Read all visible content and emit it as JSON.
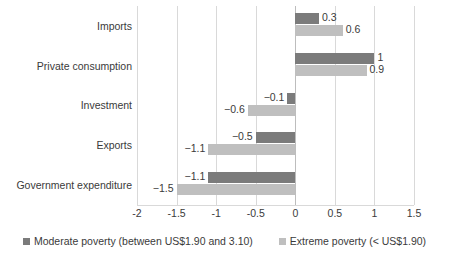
{
  "chart_data": {
    "type": "bar",
    "orientation": "horizontal",
    "title": "",
    "subtitle": "",
    "xlabel": "",
    "ylabel": "",
    "xlim": [
      -2,
      1.5
    ],
    "xticks": [
      "-2",
      "-1.5",
      "-1",
      "-0.5",
      "0",
      "0.5",
      "1",
      "1.5"
    ],
    "xtick_values": [
      -2,
      -1.5,
      -1,
      -0.5,
      0,
      0.5,
      1,
      1.5
    ],
    "grid": true,
    "legend_position": "bottom",
    "categories": [
      "Imports",
      "Private consumption",
      "Investment",
      "Exports",
      "Government expenditure"
    ],
    "series": [
      {
        "name": "Moderate poverty (between US$1.90 and 3.10)",
        "color": "#7b7b7b",
        "values": [
          0.3,
          1,
          -0.1,
          -0.5,
          -1.1
        ],
        "labels": [
          "0.3",
          "1",
          "−0.1",
          "−0.5",
          "−1.1"
        ]
      },
      {
        "name": "Extreme poverty (< US$1.90)",
        "color": "#bfbfbf",
        "values": [
          0.6,
          0.9,
          -0.6,
          -1.1,
          -1.5
        ],
        "labels": [
          "0.6",
          "0.9",
          "−0.6",
          "−1.1",
          "−1.5"
        ]
      }
    ]
  },
  "legend": {
    "items": [
      {
        "label": "Moderate poverty (between US$1.90 and 3.10)"
      },
      {
        "label": "Extreme poverty (< US$1.90)"
      }
    ]
  },
  "colors": {
    "moderate": "#7b7b7b",
    "extreme": "#bfbfbf",
    "gridline": "#d9d9d9",
    "text": "#3a3a3a",
    "background": "#ffffff"
  }
}
